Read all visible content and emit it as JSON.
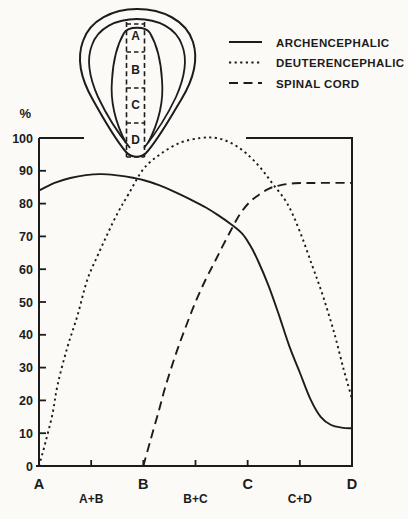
{
  "figure": {
    "background": "#fbfaf7",
    "ink": "#1c1c1c"
  },
  "legend": {
    "position": "top-right",
    "items": [
      {
        "label": "ARCHENCEPHALIC",
        "style": "solid"
      },
      {
        "label": "DEUTERENCEPHALIC",
        "style": "dotted"
      },
      {
        "label": "SPINAL CORD",
        "style": "dashed"
      }
    ]
  },
  "inset": {
    "sections": [
      "A",
      "B",
      "C",
      "D"
    ]
  },
  "chart_data": {
    "type": "line",
    "title": "",
    "xlabel": "",
    "ylabel": "%",
    "ylim": [
      0,
      100
    ],
    "grid": false,
    "legend_position": "top-right",
    "yticks": [
      100,
      90,
      80,
      70,
      60,
      50,
      40,
      30,
      20,
      10,
      0
    ],
    "x_axis": {
      "major_labels": [
        "A",
        "B",
        "C",
        "D"
      ],
      "major_positions": [
        0,
        1,
        2,
        3
      ],
      "minor_labels": [
        "A+B",
        "B+C",
        "C+D"
      ],
      "minor_positions": [
        0.5,
        1.5,
        2.5
      ],
      "tick_positions": [
        0.5,
        1,
        1.5,
        2,
        2.5
      ]
    },
    "series": [
      {
        "name": "ARCHENCEPHALIC",
        "style": "solid",
        "points": [
          [
            0.0,
            84.0
          ],
          [
            0.15,
            86.3
          ],
          [
            0.3,
            87.8
          ],
          [
            0.45,
            88.7
          ],
          [
            0.6,
            89.0
          ],
          [
            0.75,
            88.6
          ],
          [
            0.9,
            87.9
          ],
          [
            1.0,
            87.2
          ],
          [
            1.15,
            85.6
          ],
          [
            1.3,
            83.6
          ],
          [
            1.45,
            81.3
          ],
          [
            1.6,
            78.8
          ],
          [
            1.72,
            76.4
          ],
          [
            1.85,
            73.5
          ],
          [
            1.95,
            70.8
          ],
          [
            2.02,
            67.5
          ],
          [
            2.1,
            62.5
          ],
          [
            2.2,
            55.0
          ],
          [
            2.3,
            46.0
          ],
          [
            2.4,
            36.5
          ],
          [
            2.5,
            28.5
          ],
          [
            2.6,
            20.5
          ],
          [
            2.7,
            15.0
          ],
          [
            2.8,
            12.5
          ],
          [
            2.9,
            11.7
          ],
          [
            3.0,
            11.5
          ]
        ]
      },
      {
        "name": "DEUTERENCEPHALIC",
        "style": "dotted",
        "points": [
          [
            0.0,
            0.0
          ],
          [
            0.06,
            7.0
          ],
          [
            0.13,
            16.0
          ],
          [
            0.18,
            25.0
          ],
          [
            0.27,
            36.0
          ],
          [
            0.37,
            46.0
          ],
          [
            0.46,
            56.5
          ],
          [
            0.56,
            64.0
          ],
          [
            0.66,
            71.0
          ],
          [
            0.76,
            77.5
          ],
          [
            0.86,
            83.0
          ],
          [
            1.0,
            90.5
          ],
          [
            1.16,
            95.0
          ],
          [
            1.35,
            98.5
          ],
          [
            1.55,
            100.0
          ],
          [
            1.7,
            100.0
          ],
          [
            1.84,
            98.5
          ],
          [
            1.98,
            95.5
          ],
          [
            2.12,
            91.0
          ],
          [
            2.24,
            86.0
          ],
          [
            2.38,
            80.0
          ],
          [
            2.5,
            71.5
          ],
          [
            2.62,
            61.0
          ],
          [
            2.72,
            52.0
          ],
          [
            2.83,
            40.5
          ],
          [
            2.92,
            29.5
          ],
          [
            3.0,
            20.5
          ]
        ]
      },
      {
        "name": "SPINAL CORD",
        "style": "dashed",
        "points": [
          [
            1.0,
            0.0
          ],
          [
            1.07,
            8.0
          ],
          [
            1.15,
            17.0
          ],
          [
            1.21,
            24.0
          ],
          [
            1.31,
            34.0
          ],
          [
            1.39,
            41.0
          ],
          [
            1.5,
            50.0
          ],
          [
            1.6,
            57.0
          ],
          [
            1.68,
            62.0
          ],
          [
            1.76,
            67.0
          ],
          [
            1.85,
            72.5
          ],
          [
            1.93,
            77.0
          ],
          [
            2.02,
            80.5
          ],
          [
            2.1,
            82.5
          ],
          [
            2.2,
            84.5
          ],
          [
            2.3,
            85.5
          ],
          [
            2.45,
            86.2
          ],
          [
            2.7,
            86.3
          ],
          [
            3.0,
            86.3
          ]
        ]
      }
    ]
  }
}
